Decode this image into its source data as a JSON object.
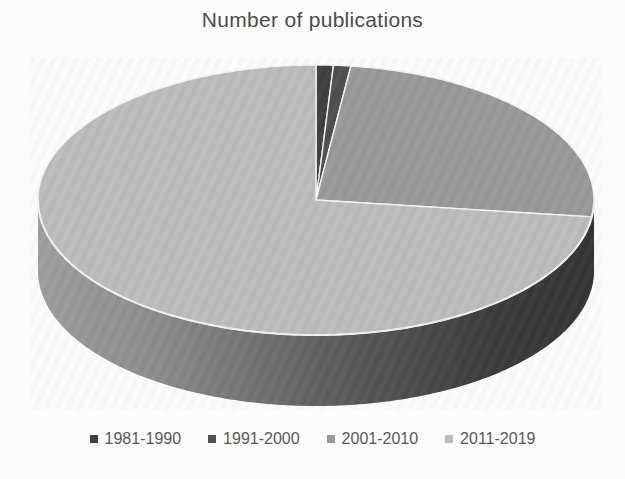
{
  "chart_data": {
    "type": "pie",
    "title": "Number of publications",
    "categories": [
      "1981-1990",
      "1991-2000",
      "2001-2010",
      "2011-2019"
    ],
    "values": [
      1,
      1,
      25,
      73
    ],
    "values_unit": "percent of total (estimated from slice angles; no data labels shown)",
    "start_angle_deg": 0,
    "direction": "clockwise",
    "effect": "3d",
    "colors": [
      "#404040",
      "#4f4f4f",
      "#999999",
      "#bcbcbc"
    ],
    "legend_position": "bottom",
    "title_color": "#4c4c4c",
    "legend_text_color": "#585858",
    "layout": {
      "cx": 316,
      "cy": 200,
      "rx": 278,
      "ry": 135,
      "depth": 71,
      "slice_stroke": "#f4f4f4",
      "rim_stroke": "#f0f0f0",
      "side_gradient": [
        "#9e9e9e",
        "#8b8b8b",
        "#5a5a5a",
        "#3c3c3c",
        "#343434"
      ],
      "side_gradient_offsets": [
        0,
        0.22,
        0.55,
        0.82,
        1
      ]
    }
  }
}
